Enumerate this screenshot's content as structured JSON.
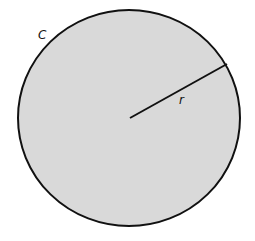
{
  "diagram": {
    "title": "",
    "circle": {
      "fill": "#d9d9d9",
      "stroke": "#111111"
    },
    "labels": {
      "circumference": "C",
      "radius": "r"
    }
  }
}
